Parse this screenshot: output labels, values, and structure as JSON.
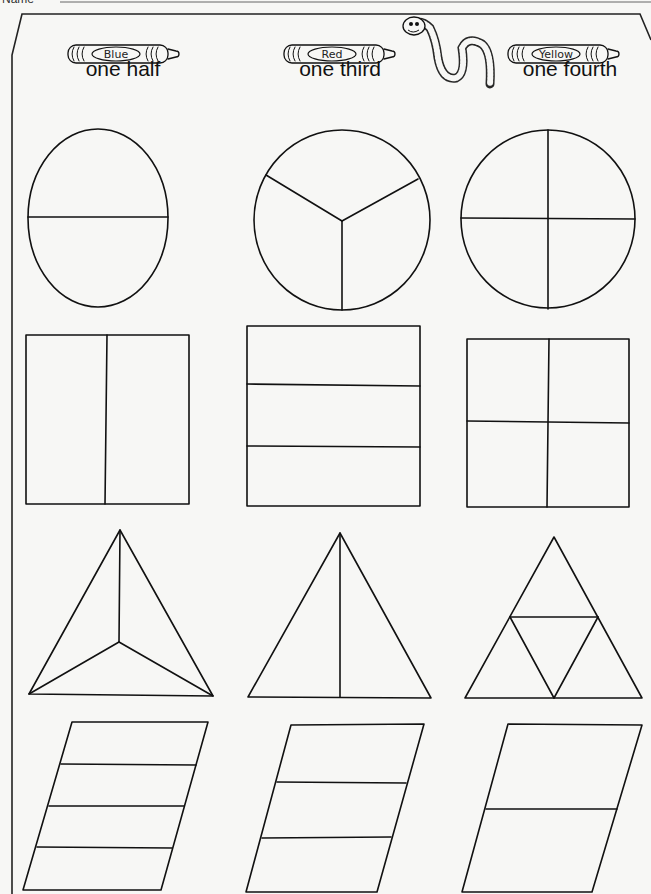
{
  "header": {
    "name_label": "Name"
  },
  "columns": [
    {
      "crayon_label": "Blue",
      "color": "#1f5fd6",
      "heading": "one half",
      "parts": 2
    },
    {
      "crayon_label": "Red",
      "color": "#d62828",
      "heading": "one third",
      "parts": 3
    },
    {
      "crayon_label": "Yellow",
      "color": "#f2c200",
      "heading": "one fourth",
      "parts": 4
    }
  ],
  "rows": [
    {
      "shape": "circle",
      "divisions": [
        2,
        3,
        4
      ]
    },
    {
      "shape": "rectangle",
      "divisions": [
        2,
        3,
        4
      ]
    },
    {
      "shape": "triangle",
      "divisions": [
        3,
        2,
        4
      ]
    },
    {
      "shape": "parallelogram",
      "divisions": [
        4,
        3,
        2
      ]
    }
  ],
  "decorations": {
    "mascot": "worm-icon"
  }
}
